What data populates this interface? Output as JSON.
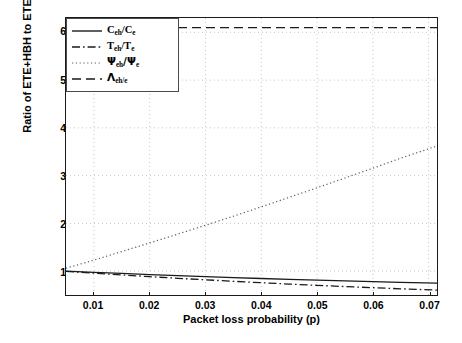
{
  "chart_data": {
    "type": "line",
    "title": "",
    "xlabel": "Packet loss probability (p)",
    "ylabel": "Ratio of ETE+HBH to ETE",
    "xlim": [
      0.005,
      0.0715
    ],
    "ylim": [
      0.5,
      6.3
    ],
    "xticks": [
      0.01,
      0.02,
      0.03,
      0.04,
      0.05,
      0.06,
      0.07
    ],
    "xtick_labels": [
      "0.01",
      "0.02",
      "0.03",
      "0.04",
      "0.05",
      "0.06",
      "0.07"
    ],
    "yticks": [
      1,
      2,
      3,
      4,
      5,
      6
    ],
    "ytick_labels": [
      "1",
      "2",
      "3",
      "4",
      "5",
      "6"
    ],
    "grid": true,
    "grid_style": "dotted",
    "legend_position": "top-left-inside",
    "x": [
      0.005,
      0.01,
      0.015,
      0.02,
      0.025,
      0.03,
      0.035,
      0.04,
      0.045,
      0.05,
      0.055,
      0.06,
      0.065,
      0.0715
    ],
    "series": [
      {
        "name": "C_eh/C_e",
        "label_base": "C",
        "label_sub1": "eh",
        "label_mid": "/C",
        "label_sub2": "e",
        "linestyle": "solid",
        "color": "#1a1a1a",
        "values": [
          1.0,
          0.975,
          0.951,
          0.928,
          0.906,
          0.885,
          0.865,
          0.846,
          0.828,
          0.811,
          0.795,
          0.78,
          0.766,
          0.75
        ]
      },
      {
        "name": "T_eh/T_e",
        "label_base": "T",
        "label_sub1": "eh",
        "label_mid": "/T",
        "label_sub2": "e",
        "linestyle": "dashdot",
        "color": "#1a1a1a",
        "values": [
          0.995,
          0.957,
          0.92,
          0.884,
          0.85,
          0.818,
          0.787,
          0.757,
          0.729,
          0.702,
          0.677,
          0.653,
          0.63,
          0.602
        ]
      },
      {
        "name": "Psi_eh/Psi_e",
        "label_base": "Ψ",
        "label_sub1": "eh",
        "label_mid": "/Ψ",
        "label_sub2": "e",
        "linestyle": "dotted",
        "color": "#5a5a5a",
        "values": [
          1.06,
          1.23,
          1.41,
          1.59,
          1.775,
          1.96,
          2.15,
          2.345,
          2.545,
          2.745,
          2.95,
          3.155,
          3.365,
          3.62
        ]
      },
      {
        "name": "Lambda_eh/e",
        "label_base": "Λ",
        "label_sub1": "eh/e",
        "label_mid": "",
        "label_sub2": "",
        "linestyle": "dashed",
        "color": "#1a1a1a",
        "values": [
          6.1,
          6.1,
          6.1,
          6.1,
          6.1,
          6.1,
          6.1,
          6.1,
          6.1,
          6.1,
          6.1,
          6.1,
          6.1,
          6.1
        ]
      }
    ]
  }
}
